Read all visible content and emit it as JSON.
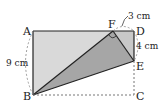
{
  "diagram": {
    "type": "geometry",
    "points": {
      "A": {
        "label": "A",
        "x": 33,
        "y": 31
      },
      "B": {
        "label": "B",
        "x": 33,
        "y": 95
      },
      "C": {
        "label": "C",
        "x": 134,
        "y": 95
      },
      "D": {
        "label": "D",
        "x": 134,
        "y": 31
      },
      "E": {
        "label": "E",
        "x": 134,
        "y": 61
      },
      "F": {
        "label": "F",
        "x": 113,
        "y": 31
      }
    },
    "measurements": {
      "AB": "9 cm",
      "FD": "3 cm",
      "DE": "4 cm"
    },
    "colors": {
      "light_fill": "#d9d9d9",
      "dark_fill": "#a6a6a6",
      "mid_fill": "#c4c4c4",
      "stroke": "#222222",
      "dotted": "#777777"
    }
  }
}
